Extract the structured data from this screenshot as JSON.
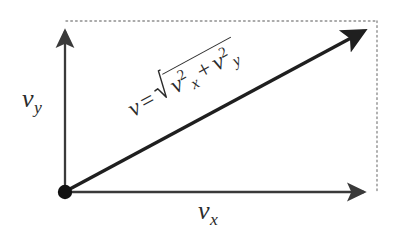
{
  "figure": {
    "type": "vector-decomposition-diagram",
    "background_color": "#ffffff",
    "stroke_color": "#2b2b2b",
    "dotted_color": "#8a8a8a",
    "origin_dot_color": "#111111"
  },
  "labels": {
    "y_axis": {
      "symbol": "v",
      "subscript": "y",
      "full_text": "v_y"
    },
    "x_axis": {
      "symbol": "v",
      "subscript": "x",
      "full_text": "v_x"
    }
  },
  "formula": {
    "lhs": "v",
    "equals": "=",
    "term1_symbol": "v",
    "term1_sub": "x",
    "term1_sup": "2",
    "operator": "+",
    "term2_symbol": "v",
    "term2_sub": "y",
    "term2_sup": "2",
    "full_text": "v = √(v²ₓ + v²ᵧ)",
    "rotation_degrees": "-28.5"
  },
  "geometry": {
    "origin": {
      "x": 65,
      "y": 192
    },
    "y_axis_tip": {
      "x": 65,
      "y": 25
    },
    "x_axis_tip": {
      "x": 372,
      "y": 192
    },
    "resultant_tip": {
      "x": 372,
      "y": 26
    },
    "dotted_top_y": 21,
    "dotted_right_x": 377,
    "origin_dot_radius": 7
  }
}
